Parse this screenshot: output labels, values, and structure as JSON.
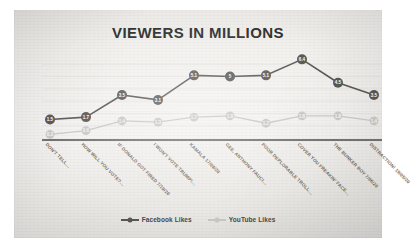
{
  "chart_data": {
    "type": "line",
    "title": "VIEWERS IN MILLIONS",
    "xlabel": "",
    "ylabel": "",
    "ylim": [
      0,
      7
    ],
    "grid": true,
    "legend_position": "bottom",
    "categories": [
      "DON'T TELL…",
      "HOW WILL YOU VOTE?…",
      "IF DONALD GOT FIRED 7/19/20",
      "I WON'T VOTE TRUMP!…",
      "KAMALA 17/08/20",
      "GEE, ANTHONY FAUCI…",
      "POOR DEPLORABLE TROLL…",
      "COVER YOU FREAKIN' FACE…",
      "THE BUNKER BOY 7/06/20",
      "DISTRACTION! 19/05/20"
    ],
    "series": [
      {
        "name": "Facebook Likes",
        "color": "#595755",
        "label_color": "#ffffff",
        "values": [
          1.5,
          1.7,
          3.5,
          3.1,
          5.1,
          5,
          5.1,
          6.4,
          4.5,
          3.5
        ],
        "value_labels": [
          "1.5",
          "1.7",
          "3.5",
          "3.1",
          "5.1",
          "5",
          "5.1",
          "6.4",
          "4.5",
          "3.5"
        ]
      },
      {
        "name": "YouTube Likes",
        "color": "#c9c7c4",
        "label_color": "#f4f3f1",
        "values": [
          0.3,
          0.6,
          1.4,
          1.3,
          1.7,
          1.8,
          1.2,
          1.8,
          1.8,
          1.4
        ],
        "value_labels": [
          "0.3",
          "0.6",
          "1.4",
          "1.3",
          "1.7",
          "1.8",
          "1.2",
          "1.8",
          "1.8",
          "1.4"
        ]
      }
    ]
  },
  "legend": {
    "items": [
      {
        "label": "Facebook Likes",
        "color": "#595755"
      },
      {
        "label": "YouTube Likes",
        "color": "#c9c7c4"
      }
    ]
  },
  "colors": {
    "axis": "#4a4845",
    "gridline": "#dedcd8",
    "panel": "#f2f1ee"
  }
}
